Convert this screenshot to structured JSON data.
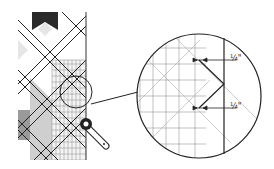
{
  "diagram": {
    "type": "quilting-trim-diagram",
    "labels": {
      "top_measure": "¼\"",
      "bottom_measure": "¼\""
    },
    "colors": {
      "line": "#222222",
      "dark_fabric": "#2a2a2a",
      "mid_fabric": "#9a9a9a",
      "light_fabric": "#cfcfcf",
      "pale_fabric": "#e6e6e6",
      "grid": "#888888"
    }
  }
}
